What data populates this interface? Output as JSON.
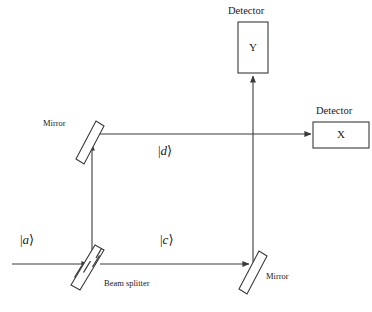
{
  "figure": {
    "type": "optics-diagram",
    "name": "Mach-Zehnder interferometer",
    "background_color": "#ffffff",
    "line_color": "#3a3a3a",
    "text_color": "#1a1a1a"
  },
  "detectors": {
    "y": {
      "caption": "Detector",
      "label": "Y",
      "box": {
        "x": 238,
        "y": 22,
        "w": 30,
        "h": 51
      }
    },
    "x": {
      "caption": "Detector",
      "label": "X",
      "box": {
        "x": 313,
        "y": 122,
        "w": 56,
        "h": 26
      }
    }
  },
  "components": {
    "mirror_top_left": {
      "label": "Mirror"
    },
    "mirror_bottom_right": {
      "label": "Mirror"
    },
    "beam_splitter": {
      "label": "Beam splitter"
    }
  },
  "beams": {
    "input": {
      "ket_open": "|",
      "ket_symbol": "a",
      "ket_close": "⟩"
    },
    "lower_arm": {
      "ket_open": "|",
      "ket_symbol": "c",
      "ket_close": "⟩"
    },
    "upper_arm": {
      "ket_open": "|",
      "ket_symbol": "d",
      "ket_close": "⟩"
    }
  },
  "bleed_through_text": [
    {
      "text": " ",
      "x": 8,
      "y": 8
    }
  ]
}
